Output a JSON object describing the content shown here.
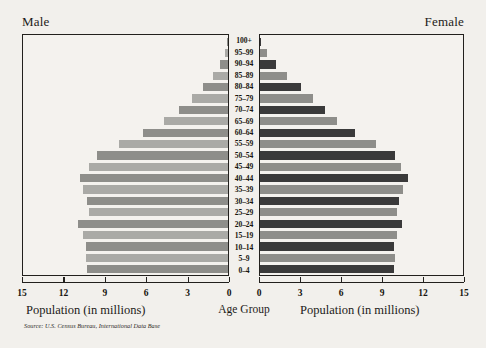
{
  "headers": {
    "male": "Male",
    "female": "Female"
  },
  "captions": {
    "left_axis": "Population (in millions)",
    "right_axis": "Population (in millions)",
    "center_axis": "Age Group"
  },
  "source": "Source: U.S. Census Bureau, International Data Base",
  "colors": {
    "background": "#f2f0ec",
    "panel": "#f4f2ee",
    "frame": "#22201d",
    "bar_dark": "#3a3a3a",
    "bar_light": "#aaaaa6",
    "bar_mid": "#8e8e8a",
    "text": "#17150f"
  },
  "axis": {
    "left_ticks": [
      "15",
      "12",
      "9",
      "6",
      "3",
      "0"
    ],
    "right_ticks": [
      "0",
      "3",
      "6",
      "9",
      "12",
      "15"
    ],
    "max": 15,
    "unit": "millions"
  },
  "chart_data": {
    "type": "bar",
    "title": "",
    "subtype": "population-pyramid",
    "xlabel": "Population (in millions)",
    "ylabel": "Age Group",
    "xlim": [
      0,
      15
    ],
    "grid": false,
    "legend": [
      "Male",
      "Female"
    ],
    "categories": [
      "100+",
      "95–99",
      "90–94",
      "85–89",
      "80–84",
      "75–79",
      "70–74",
      "65–69",
      "60–64",
      "55–59",
      "50–54",
      "45–49",
      "40–44",
      "35–39",
      "30–34",
      "25–29",
      "20–24",
      "15–19",
      "10–14",
      "5–9",
      "0–4"
    ],
    "series": [
      {
        "name": "Male",
        "side": "left",
        "values": [
          0.05,
          0.25,
          0.6,
          1.1,
          1.8,
          2.6,
          3.6,
          4.7,
          6.2,
          8.0,
          9.6,
          10.2,
          10.8,
          10.6,
          10.3,
          10.2,
          11.0,
          10.6,
          10.4,
          10.4,
          10.3
        ]
      },
      {
        "name": "Female",
        "side": "right",
        "values": [
          0.1,
          0.5,
          1.2,
          2.0,
          3.0,
          3.9,
          4.8,
          5.7,
          7.0,
          8.6,
          10.0,
          10.4,
          10.9,
          10.6,
          10.3,
          10.1,
          10.5,
          10.1,
          9.9,
          10.0,
          9.9
        ]
      }
    ]
  }
}
